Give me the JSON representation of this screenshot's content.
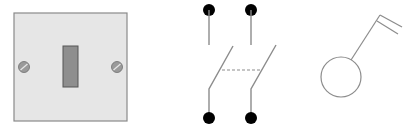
{
  "figure": {
    "panels": [
      {
        "name": "switch-plate",
        "kind": "illustration"
      },
      {
        "name": "double-pole-switch-symbol",
        "kind": "schematic"
      },
      {
        "name": "pull-switch-symbol",
        "kind": "schematic"
      }
    ]
  },
  "colors": {
    "plate_fill": "#e6e6e6",
    "plate_border": "#8a8a8a",
    "toggle_fill": "#8e8e8e",
    "toggle_border": "#555555",
    "screw_fill": "#9a9a9a",
    "line": "#8c8c8c",
    "terminal": "#000000"
  }
}
